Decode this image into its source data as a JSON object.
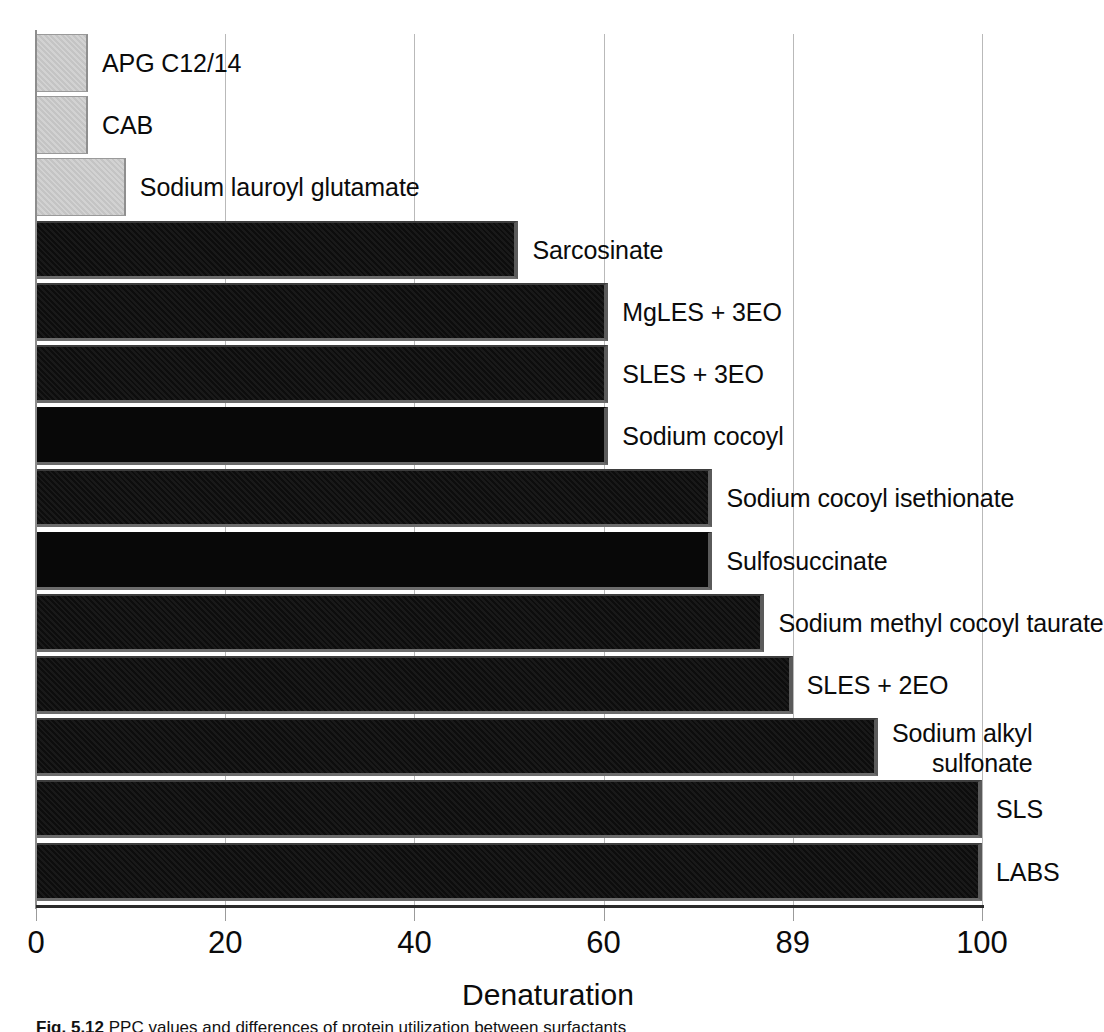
{
  "chart_data": {
    "type": "bar",
    "orientation": "horizontal",
    "title": "",
    "xlabel": "Denaturation",
    "ylabel": "",
    "xlim": [
      0,
      100
    ],
    "grid": true,
    "legend": "none",
    "bar_colors": {
      "light": "#c9c9c9",
      "dark": "#111111"
    },
    "xticks": [
      {
        "label": "0",
        "value": 0
      },
      {
        "label": "20",
        "value": 20
      },
      {
        "label": "40",
        "value": 40
      },
      {
        "label": "60",
        "value": 60
      },
      {
        "label": "89",
        "value": 80
      },
      {
        "label": "100",
        "value": 100
      }
    ],
    "categories": [
      "APG C12/14",
      "CAB",
      "Sodium lauroyl glutamate",
      "Sarcosinate",
      "MgLES + 3EO",
      "SLES + 3EO",
      "Sodium cocoyl",
      "Sodium cocoyl isethionate",
      "Sulfosuccinate",
      "Sodium methyl cocoyl taurate",
      "SLES + 2EO",
      "Sodium alkyl sulfonate",
      "SLS",
      "LABS"
    ],
    "values": [
      5.5,
      5.5,
      9.5,
      51,
      60.5,
      60.5,
      60.5,
      71.5,
      71.5,
      77,
      80,
      89,
      100,
      100
    ],
    "series": [
      {
        "name": "Denaturation",
        "values": [
          5.5,
          5.5,
          9.5,
          51,
          60.5,
          60.5,
          60.5,
          71.5,
          71.5,
          77,
          80,
          89,
          100,
          100
        ]
      }
    ],
    "bars": [
      {
        "label": "APG C12/14",
        "value": 5.5,
        "shade": "light",
        "label_lines": [
          "APG C12/14"
        ]
      },
      {
        "label": "CAB",
        "value": 5.5,
        "shade": "light",
        "label_lines": [
          "CAB"
        ]
      },
      {
        "label": "Sodium lauroyl glutamate",
        "value": 9.5,
        "shade": "light",
        "label_lines": [
          "Sodium lauroyl glutamate"
        ]
      },
      {
        "label": "Sarcosinate",
        "value": 51,
        "shade": "dark",
        "label_lines": [
          "Sarcosinate"
        ]
      },
      {
        "label": "MgLES + 3EO",
        "value": 60.5,
        "shade": "dark",
        "label_lines": [
          "MgLES + 3EO"
        ]
      },
      {
        "label": "SLES + 3EO",
        "value": 60.5,
        "shade": "dark",
        "label_lines": [
          "SLES + 3EO"
        ]
      },
      {
        "label": "Sodium cocoyl",
        "value": 60.5,
        "shade": "dark",
        "label_lines": [
          "Sodium cocoyl"
        ]
      },
      {
        "label": "Sodium cocoyl isethionate",
        "value": 71.5,
        "shade": "dark",
        "label_lines": [
          "Sodium cocoyl isethionate"
        ]
      },
      {
        "label": "Sulfosuccinate",
        "value": 71.5,
        "shade": "dark",
        "label_lines": [
          "Sulfosuccinate"
        ]
      },
      {
        "label": "Sodium methyl cocoyl taurate",
        "value": 77,
        "shade": "dark",
        "label_lines": [
          "Sodium methyl cocoyl taurate"
        ]
      },
      {
        "label": "SLES + 2EO",
        "value": 80,
        "shade": "dark",
        "label_lines": [
          "SLES + 2EO"
        ]
      },
      {
        "label": "Sodium alkyl sulfonate",
        "value": 89,
        "shade": "dark",
        "label_lines": [
          "Sodium alkyl",
          "sulfonate"
        ]
      },
      {
        "label": "SLS",
        "value": 100,
        "shade": "dark",
        "label_lines": [
          "SLS"
        ]
      },
      {
        "label": "LABS",
        "value": 100,
        "shade": "dark",
        "label_lines": [
          "LABS"
        ]
      }
    ]
  },
  "caption": {
    "prefix": "Fig. 5.12",
    "text": "  PPC values and differences of protein utilization between surfactants"
  }
}
